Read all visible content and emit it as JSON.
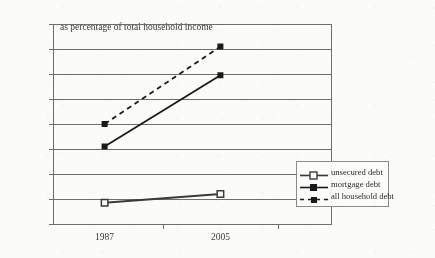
{
  "chart_data": {
    "type": "line",
    "title": "as percentage of total household income",
    "xlabel": "",
    "ylabel": "",
    "categories": [
      "1987",
      "2005"
    ],
    "x": [
      1987,
      2005
    ],
    "ylim": [
      0,
      160
    ],
    "yticks": [
      "0%",
      "20%",
      "40%",
      "60%",
      "80%",
      "100%",
      "120%",
      "140%",
      "160%"
    ],
    "ytick_values": [
      0,
      20,
      40,
      60,
      80,
      100,
      120,
      140,
      160
    ],
    "grid": true,
    "legend_position": "bottom-right",
    "series": [
      {
        "name": "unsecured debt",
        "values": [
          17,
          24
        ],
        "line_style": "solid",
        "marker": "open-square",
        "color": "#3a3a3a"
      },
      {
        "name": "mortgage debt",
        "values": [
          62,
          119
        ],
        "line_style": "solid",
        "marker": "filled-square",
        "color": "#1a1a1a"
      },
      {
        "name": "all household debt",
        "values": [
          80,
          142
        ],
        "line_style": "dashed",
        "marker": "filled-square",
        "color": "#1a1a1a"
      }
    ]
  },
  "axis": {
    "y_labels": [
      "160%",
      "140%",
      "120%",
      "100%",
      "80%",
      "60%",
      "40%",
      "20%",
      "0%"
    ],
    "x_labels": [
      "1987",
      "2005"
    ]
  },
  "legend": {
    "items": [
      {
        "label": "unsecured debt"
      },
      {
        "label": "mortgage debt"
      },
      {
        "label": "all household debt"
      }
    ]
  }
}
